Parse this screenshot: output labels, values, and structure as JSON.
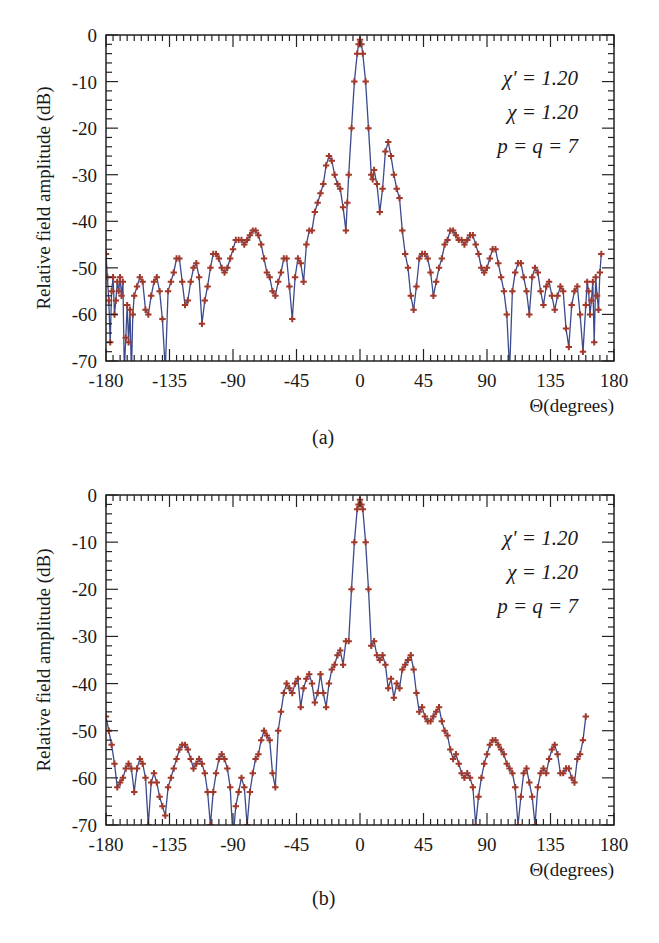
{
  "figure": {
    "captions": [
      "(a)",
      "(b)"
    ]
  },
  "colors": {
    "line": "#3b4a8c",
    "marker": "#a0392b",
    "axis": "#222222"
  },
  "chart_data": [
    {
      "type": "line",
      "id": "a",
      "caption": "(a)",
      "title": "",
      "xlabel": "Θ(degrees)",
      "ylabel": "Relative field amplitude (dB)",
      "xlim": [
        -180,
        180
      ],
      "ylim": [
        -70,
        0
      ],
      "xticks": [
        -180,
        -135,
        -90,
        -45,
        0,
        45,
        90,
        135,
        180
      ],
      "xtick_labels": [
        "-180",
        "-135",
        "-90",
        "-45",
        "0",
        "45",
        "90",
        "135",
        "180"
      ],
      "yticks": [
        0,
        -10,
        -20,
        -30,
        -40,
        -50,
        -60,
        -70
      ],
      "ytick_labels": [
        "0",
        "-10",
        "-20",
        "-30",
        "-40",
        "-50",
        "-60",
        "-70"
      ],
      "grid": false,
      "annotations": [
        "χ' = 1.20",
        "χ = 1.20",
        "p = q = 7"
      ],
      "series": [
        {
          "name": "pattern (line + markers)",
          "x": [
            -180,
            -179,
            -178,
            -177,
            -176,
            -175,
            -174,
            -173,
            -172,
            -171,
            -170,
            -169,
            -168,
            -167,
            -166,
            -165,
            -164,
            -163,
            -162,
            -161,
            -160,
            -158,
            -156,
            -154,
            -152,
            -150,
            -148,
            -146,
            -144,
            -142,
            -140,
            -138,
            -136,
            -134,
            -132,
            -130,
            -128,
            -126,
            -124,
            -122,
            -120,
            -118,
            -116,
            -114,
            -112,
            -110,
            -108,
            -106,
            -104,
            -102,
            -100,
            -98,
            -96,
            -94,
            -92,
            -90,
            -88,
            -86,
            -84,
            -82,
            -80,
            -78,
            -76,
            -74,
            -72,
            -70,
            -68,
            -66,
            -64,
            -62,
            -60,
            -58,
            -56,
            -54,
            -52,
            -50,
            -48,
            -46,
            -44,
            -42,
            -40,
            -38,
            -36,
            -34,
            -32,
            -30,
            -28,
            -26,
            -24,
            -22,
            -20,
            -18,
            -16,
            -14,
            -12,
            -10,
            -9,
            -8,
            -6,
            -4,
            -2,
            -1,
            0,
            1,
            2,
            4,
            6,
            8,
            9,
            10,
            12,
            14,
            16,
            18,
            20,
            22,
            24,
            26,
            28,
            30,
            32,
            34,
            36,
            38,
            40,
            42,
            44,
            46,
            48,
            50,
            52,
            54,
            56,
            58,
            60,
            62,
            64,
            66,
            68,
            70,
            72,
            74,
            76,
            78,
            80,
            82,
            84,
            86,
            88,
            90,
            92,
            94,
            96,
            98,
            100,
            102,
            104,
            106,
            108,
            110,
            112,
            114,
            116,
            118,
            120,
            122,
            124,
            126,
            128,
            130,
            132,
            134,
            136,
            138,
            140,
            142,
            144,
            146,
            148,
            150,
            152,
            154,
            156,
            158,
            160,
            161,
            162,
            163,
            164,
            165,
            166,
            167,
            168,
            169,
            170,
            171,
            172,
            173,
            174,
            175,
            176,
            177,
            178,
            179,
            180
          ],
          "y": [
            -47,
            -52,
            -57,
            -66,
            -55,
            -52,
            -60,
            -57,
            -53,
            -55,
            -52,
            -56,
            -53,
            -72,
            -65,
            -58,
            -66,
            -59,
            -75,
            -60,
            -56,
            -54,
            -52,
            -53,
            -59,
            -60,
            -56,
            -53,
            -52,
            -55,
            -61,
            -72,
            -55,
            -53,
            -51,
            -48,
            -48,
            -53,
            -58,
            -57,
            -53,
            -50,
            -49,
            -52,
            -62,
            -57,
            -54,
            -50,
            -47,
            -47,
            -48,
            -50,
            -51,
            -50,
            -48,
            -46,
            -44,
            -44,
            -44,
            -45,
            -44,
            -43,
            -42,
            -42,
            -43,
            -45,
            -48,
            -51,
            -52,
            -55,
            -56,
            -53,
            -51,
            -48,
            -48,
            -54,
            -61,
            -52,
            -48,
            -49,
            -53,
            -45,
            -42,
            -42,
            -38,
            -36,
            -34,
            -32,
            -28,
            -26,
            -27,
            -30,
            -32,
            -33,
            -37,
            -42,
            -36,
            -30,
            -20,
            -10,
            -4,
            -2,
            -1,
            -2,
            -4,
            -10,
            -20,
            -30,
            -31,
            -29,
            -32,
            -38,
            -33,
            -25,
            -23,
            -26,
            -30,
            -33,
            -35,
            -42,
            -47,
            -50,
            -56,
            -59,
            -54,
            -48,
            -47,
            -47,
            -48,
            -51,
            -56,
            -53,
            -50,
            -48,
            -45,
            -44,
            -42,
            -42,
            -43,
            -44,
            -44,
            -45,
            -44,
            -43,
            -43,
            -45,
            -47,
            -50,
            -51,
            -50,
            -48,
            -46,
            -46,
            -49,
            -52,
            -55,
            -60,
            -72,
            -55,
            -51,
            -49,
            -49,
            -52,
            -55,
            -60,
            -52,
            -50,
            -51,
            -55,
            -58,
            -54,
            -53,
            -56,
            -59,
            -56,
            -54,
            -55,
            -63,
            -67,
            -58,
            -55,
            -54,
            -60,
            -68,
            -58,
            -53,
            -55,
            -60,
            -57,
            -53,
            -66,
            -52,
            -56,
            -59,
            -51,
            -47
          ]
        }
      ]
    },
    {
      "type": "line",
      "id": "b",
      "caption": "(b)",
      "title": "",
      "xlabel": "Θ(degrees)",
      "ylabel": "Relative field amplitude (dB)",
      "xlim": [
        -180,
        180
      ],
      "ylim": [
        -70,
        0
      ],
      "xticks": [
        -180,
        -135,
        -90,
        -45,
        0,
        45,
        90,
        135,
        180
      ],
      "xtick_labels": [
        "-180",
        "-135",
        "-90",
        "-45",
        "0",
        "45",
        "90",
        "135",
        "180"
      ],
      "yticks": [
        0,
        -10,
        -20,
        -30,
        -40,
        -50,
        -60,
        -70
      ],
      "ytick_labels": [
        "0",
        "-10",
        "-20",
        "-30",
        "-40",
        "-50",
        "-60",
        "-70"
      ],
      "grid": false,
      "annotations": [
        "χ' = 1.20",
        "χ = 1.20",
        "p = q = 7"
      ],
      "series": [
        {
          "name": "pattern (line + markers)",
          "x": [
            -180,
            -178,
            -176,
            -174,
            -172,
            -170,
            -168,
            -166,
            -164,
            -162,
            -160,
            -158,
            -156,
            -154,
            -152,
            -150,
            -148,
            -146,
            -144,
            -142,
            -140,
            -138,
            -136,
            -134,
            -132,
            -130,
            -128,
            -126,
            -124,
            -122,
            -120,
            -118,
            -116,
            -114,
            -112,
            -110,
            -108,
            -106,
            -104,
            -102,
            -100,
            -98,
            -96,
            -94,
            -92,
            -90,
            -88,
            -86,
            -84,
            -82,
            -80,
            -78,
            -76,
            -74,
            -72,
            -70,
            -68,
            -66,
            -64,
            -62,
            -60,
            -58,
            -56,
            -54,
            -52,
            -50,
            -48,
            -46,
            -44,
            -42,
            -40,
            -38,
            -36,
            -34,
            -32,
            -30,
            -28,
            -26,
            -24,
            -22,
            -20,
            -18,
            -16,
            -14,
            -12,
            -10,
            -8,
            -6,
            -4,
            -2,
            -1,
            0,
            1,
            2,
            4,
            6,
            8,
            10,
            12,
            14,
            16,
            18,
            20,
            22,
            24,
            26,
            28,
            30,
            32,
            34,
            36,
            38,
            40,
            42,
            44,
            46,
            48,
            50,
            52,
            54,
            56,
            58,
            60,
            62,
            64,
            66,
            68,
            70,
            72,
            74,
            76,
            78,
            80,
            82,
            84,
            86,
            88,
            90,
            92,
            94,
            96,
            98,
            100,
            102,
            104,
            106,
            108,
            110,
            112,
            114,
            116,
            118,
            120,
            122,
            124,
            126,
            128,
            130,
            132,
            134,
            136,
            138,
            140,
            142,
            144,
            146,
            148,
            150,
            152,
            154,
            156,
            158,
            160,
            162,
            164,
            166,
            168,
            170,
            172,
            174,
            176,
            178,
            180
          ],
          "y": [
            -47,
            -50,
            -53,
            -57,
            -62,
            -61,
            -60,
            -58,
            -57,
            -58,
            -63,
            -58,
            -56,
            -57,
            -60,
            -70,
            -61,
            -59,
            -61,
            -64,
            -66,
            -68,
            -62,
            -60,
            -58,
            -56,
            -54,
            -53,
            -53,
            -54,
            -56,
            -58,
            -57,
            -56,
            -57,
            -59,
            -63,
            -70,
            -63,
            -59,
            -56,
            -55,
            -56,
            -58,
            -62,
            -73,
            -66,
            -63,
            -60,
            -62,
            -70,
            -63,
            -59,
            -56,
            -55,
            -52,
            -50,
            -51,
            -52,
            -59,
            -62,
            -50,
            -46,
            -42,
            -40,
            -41,
            -42,
            -40,
            -39,
            -45,
            -41,
            -39,
            -38,
            -40,
            -44,
            -42,
            -38,
            -42,
            -45,
            -40,
            -37,
            -36,
            -34,
            -33,
            -36,
            -31,
            -31,
            -20,
            -10,
            -3,
            -2,
            -1,
            -2,
            -3,
            -10,
            -20,
            -32,
            -31,
            -34,
            -35,
            -34,
            -36,
            -41,
            -39,
            -43,
            -40,
            -41,
            -37,
            -36,
            -35,
            -34,
            -37,
            -42,
            -46,
            -45,
            -47,
            -48,
            -48,
            -47,
            -46,
            -45,
            -48,
            -50,
            -51,
            -54,
            -56,
            -55,
            -57,
            -59,
            -60,
            -59,
            -60,
            -62,
            -70,
            -64,
            -60,
            -57,
            -55,
            -53,
            -52,
            -52,
            -53,
            -54,
            -55,
            -57,
            -58,
            -59,
            -62,
            -70,
            -64,
            -59,
            -58,
            -61,
            -64,
            -70,
            -62,
            -59,
            -58,
            -59,
            -56,
            -54,
            -53,
            -55,
            -59,
            -59,
            -58,
            -58,
            -60,
            -61,
            -56,
            -55,
            -52,
            -47
          ]
        }
      ]
    }
  ]
}
